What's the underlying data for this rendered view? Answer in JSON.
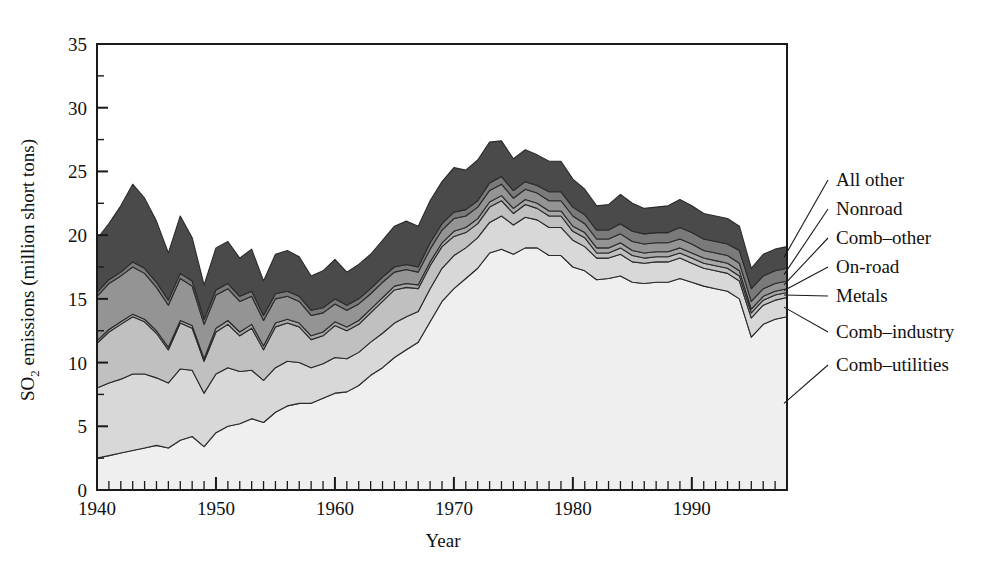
{
  "chart_data": {
    "type": "area",
    "stacked": true,
    "title": "",
    "xlabel": "Year",
    "ylabel": "SO2 emissions (million short tons)",
    "ylabel_parts": {
      "pre": "SO",
      "sub": "2",
      "post": " emissions (million short tons)"
    },
    "xlim": [
      1940,
      1998
    ],
    "ylim": [
      0,
      35
    ],
    "y_major_ticks": [
      0,
      5,
      10,
      15,
      20,
      25,
      30,
      35
    ],
    "y_minor_step": 2.5,
    "x_major_ticks": [
      1940,
      1950,
      1960,
      1970,
      1980,
      1990
    ],
    "x_tick_labels": [
      "1940",
      "1950",
      "1960",
      "1970",
      "1980",
      "1990"
    ],
    "x_minor_step": 1,
    "grid": false,
    "legend_position": "right-leader-lines",
    "x": [
      1940,
      1941,
      1942,
      1943,
      1944,
      1945,
      1946,
      1947,
      1948,
      1949,
      1950,
      1951,
      1952,
      1953,
      1954,
      1955,
      1956,
      1957,
      1958,
      1959,
      1960,
      1961,
      1962,
      1963,
      1964,
      1965,
      1966,
      1967,
      1968,
      1969,
      1970,
      1971,
      1972,
      1973,
      1974,
      1975,
      1976,
      1977,
      1978,
      1979,
      1980,
      1981,
      1982,
      1983,
      1984,
      1985,
      1986,
      1987,
      1988,
      1989,
      1990,
      1991,
      1992,
      1993,
      1994,
      1995,
      1996,
      1997,
      1998
    ],
    "series": [
      {
        "name": "Comb-utilities",
        "color": "#efefef",
        "values": [
          2.5,
          2.7,
          2.9,
          3.1,
          3.3,
          3.5,
          3.3,
          3.9,
          4.2,
          3.4,
          4.5,
          5.0,
          5.2,
          5.6,
          5.3,
          6.1,
          6.6,
          6.8,
          6.8,
          7.2,
          7.6,
          7.7,
          8.2,
          9.0,
          9.6,
          10.4,
          11.0,
          11.6,
          13.2,
          14.8,
          15.8,
          16.6,
          17.4,
          18.6,
          18.9,
          18.5,
          19.0,
          19.0,
          18.4,
          18.4,
          17.5,
          17.2,
          16.5,
          16.6,
          16.8,
          16.3,
          16.2,
          16.3,
          16.3,
          16.6,
          16.3,
          16.0,
          15.8,
          15.6,
          15.0,
          12.0,
          13.0,
          13.4,
          13.6
        ]
      },
      {
        "name": "Comb-industry",
        "color": "#d8d8d8",
        "values": [
          5.5,
          5.7,
          5.8,
          6.0,
          5.8,
          5.3,
          5.1,
          5.6,
          5.2,
          4.2,
          4.6,
          4.6,
          4.1,
          3.8,
          3.3,
          3.5,
          3.5,
          3.2,
          2.8,
          2.7,
          2.8,
          2.6,
          2.6,
          2.6,
          2.7,
          2.7,
          2.6,
          2.4,
          2.6,
          2.6,
          2.6,
          2.4,
          2.4,
          2.4,
          2.6,
          2.3,
          2.4,
          2.2,
          2.2,
          2.2,
          2.1,
          1.9,
          1.7,
          1.6,
          1.7,
          1.6,
          1.6,
          1.6,
          1.6,
          1.6,
          1.5,
          1.4,
          1.4,
          1.4,
          1.4,
          1.5,
          1.5,
          1.5,
          1.5
        ]
      },
      {
        "name": "Metals",
        "color": "#c0c0c0",
        "values": [
          3.5,
          4.0,
          4.3,
          4.5,
          4.1,
          3.5,
          2.6,
          3.6,
          3.3,
          2.5,
          3.3,
          3.4,
          2.8,
          3.3,
          2.4,
          3.2,
          3.0,
          2.8,
          2.2,
          2.2,
          2.5,
          2.2,
          2.2,
          2.3,
          2.5,
          2.6,
          2.3,
          1.8,
          1.8,
          1.7,
          1.5,
          1.2,
          1.1,
          1.2,
          1.2,
          0.9,
          1.0,
          0.9,
          0.9,
          0.9,
          0.7,
          0.7,
          0.4,
          0.4,
          0.5,
          0.5,
          0.4,
          0.4,
          0.4,
          0.4,
          0.4,
          0.4,
          0.4,
          0.4,
          0.4,
          0.4,
          0.4,
          0.4,
          0.4
        ]
      },
      {
        "name": "On-road",
        "color": "#a8a8a8",
        "values": [
          0.2,
          0.2,
          0.2,
          0.2,
          0.2,
          0.2,
          0.2,
          0.2,
          0.2,
          0.2,
          0.3,
          0.3,
          0.3,
          0.3,
          0.3,
          0.3,
          0.3,
          0.3,
          0.3,
          0.3,
          0.3,
          0.3,
          0.3,
          0.3,
          0.3,
          0.3,
          0.3,
          0.3,
          0.3,
          0.3,
          0.4,
          0.4,
          0.4,
          0.4,
          0.4,
          0.4,
          0.4,
          0.4,
          0.4,
          0.4,
          0.4,
          0.4,
          0.4,
          0.4,
          0.4,
          0.4,
          0.4,
          0.4,
          0.4,
          0.4,
          0.4,
          0.4,
          0.4,
          0.4,
          0.4,
          0.3,
          0.3,
          0.3,
          0.3
        ]
      },
      {
        "name": "Comb-other",
        "color": "#949494",
        "values": [
          3.5,
          3.6,
          3.6,
          3.7,
          3.6,
          3.4,
          3.3,
          3.3,
          3.1,
          2.7,
          2.6,
          2.5,
          2.4,
          2.2,
          2.0,
          1.9,
          1.8,
          1.7,
          1.6,
          1.5,
          1.4,
          1.3,
          1.3,
          1.2,
          1.2,
          1.1,
          1.1,
          1.0,
          1.0,
          1.0,
          1.0,
          0.9,
          0.9,
          0.9,
          0.9,
          0.8,
          0.8,
          0.8,
          0.8,
          0.8,
          0.8,
          0.7,
          0.7,
          0.7,
          0.7,
          0.7,
          0.7,
          0.7,
          0.7,
          0.7,
          0.7,
          0.6,
          0.6,
          0.6,
          0.6,
          0.6,
          0.6,
          0.6,
          0.6
        ]
      },
      {
        "name": "Nonroad",
        "color": "#7a7a7a",
        "values": [
          0.3,
          0.3,
          0.3,
          0.4,
          0.4,
          0.4,
          0.4,
          0.4,
          0.4,
          0.4,
          0.4,
          0.4,
          0.4,
          0.4,
          0.4,
          0.4,
          0.4,
          0.4,
          0.4,
          0.4,
          0.4,
          0.4,
          0.4,
          0.4,
          0.4,
          0.4,
          0.4,
          0.4,
          0.5,
          0.5,
          0.5,
          0.5,
          0.5,
          0.6,
          0.6,
          0.6,
          0.6,
          0.6,
          0.7,
          0.7,
          0.7,
          0.7,
          0.7,
          0.7,
          0.8,
          0.8,
          0.8,
          0.8,
          0.8,
          0.9,
          0.9,
          0.9,
          0.9,
          0.9,
          1.0,
          1.0,
          1.0,
          1.0,
          1.0
        ]
      },
      {
        "name": "All other",
        "color": "#4a4a4a",
        "values": [
          4.2,
          4.4,
          5.2,
          6.1,
          5.5,
          4.8,
          3.7,
          4.5,
          3.4,
          2.7,
          3.3,
          3.3,
          3.0,
          3.3,
          2.7,
          3.1,
          3.2,
          3.1,
          2.7,
          2.9,
          3.1,
          2.6,
          2.7,
          2.7,
          2.9,
          3.2,
          3.4,
          3.2,
          3.3,
          3.3,
          3.5,
          3.1,
          3.2,
          3.2,
          2.8,
          2.5,
          2.5,
          2.4,
          2.4,
          2.4,
          2.2,
          2.0,
          1.9,
          2.0,
          2.3,
          2.2,
          2.0,
          2.0,
          2.1,
          2.2,
          2.1,
          2.0,
          2.0,
          2.0,
          1.9,
          1.6,
          1.7,
          1.7,
          1.7
        ]
      }
    ],
    "legend_entries": [
      {
        "label": "All other",
        "color": "#4a4a4a"
      },
      {
        "label": "Nonroad",
        "color": "#7a7a7a"
      },
      {
        "label": "Comb–other",
        "color": "#949494"
      },
      {
        "label": "On-road",
        "color": "#a8a8a8"
      },
      {
        "label": "Metals",
        "color": "#c0c0c0"
      },
      {
        "label": "Comb–industry",
        "color": "#d8d8d8"
      },
      {
        "label": "Comb–utilities",
        "color": "#efefef"
      }
    ]
  }
}
